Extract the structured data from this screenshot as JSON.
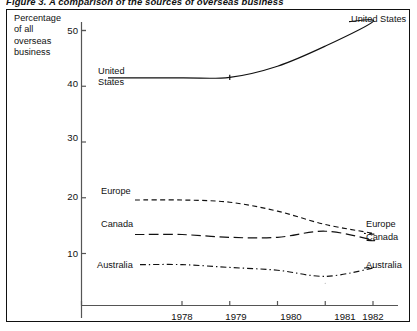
{
  "figure": {
    "caption": "Figure 3. A comparison of the sources of overseas business"
  },
  "axes": {
    "y_axis_title_lines": [
      "Percentage",
      "of all",
      "overseas",
      "business"
    ],
    "y_ticks": [
      50,
      40,
      30,
      20,
      10
    ],
    "x_ticks": [
      "1978",
      "1979",
      "1980",
      "1981",
      "1982"
    ]
  },
  "labels": {
    "us_left_lines": [
      "United",
      "States"
    ],
    "us_right": "United States",
    "europe_left": "Europe",
    "europe_right": "Europe",
    "canada_left": "Canada",
    "canada_right": "Canada",
    "australia_left": "Australia",
    "australia_right": "Australia"
  },
  "colors": {
    "ink": "#111111",
    "frame": "#111111",
    "axis": "#555555",
    "background": "#ffffff"
  },
  "chart_data": {
    "type": "line",
    "title": "Figure 3. A comparison of the sources of overseas business",
    "xlabel": "",
    "ylabel": "Percentage of all overseas business",
    "x": [
      1978,
      1979,
      1980,
      1981,
      1982
    ],
    "xlim": [
      1977.55,
      1982.6
    ],
    "ylim": [
      3.5,
      53
    ],
    "yticks": [
      10,
      20,
      30,
      40,
      50
    ],
    "xticks": [
      1978,
      1979,
      1980,
      1981,
      1982
    ],
    "grid": false,
    "legend": "inline-endpoint-labels",
    "series": [
      {
        "name": "United States",
        "dash": "solid",
        "values": [
          41.5,
          41.6,
          43.6,
          47.2,
          51.6
        ]
      },
      {
        "name": "Europe",
        "dash": "dashed",
        "values": [
          19.6,
          19.2,
          17.6,
          15.2,
          13.6
        ]
      },
      {
        "name": "Canada",
        "dash": "long-dash",
        "values": [
          13.4,
          12.9,
          12.9,
          14.0,
          12.4
        ]
      },
      {
        "name": "Australia",
        "dash": "dash-dot",
        "values": [
          8.0,
          7.5,
          7.0,
          5.9,
          7.4
        ]
      }
    ]
  }
}
